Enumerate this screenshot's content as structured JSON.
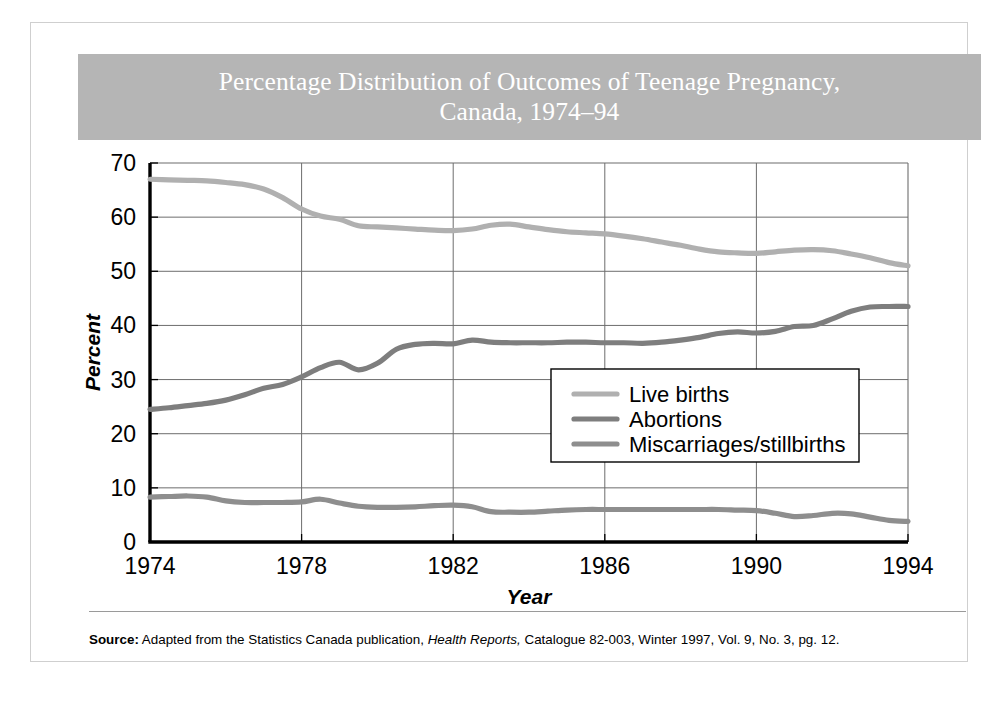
{
  "figure": {
    "title": "Percentage Distribution of Outcomes of Teenage Pregnancy,\nCanada, 1974–94",
    "title_banner_color": "#b5b5b5",
    "title_text_color": "#ffffff",
    "background_color": "#ffffff",
    "border_color": "#cfcfcf"
  },
  "source": {
    "label": "Source:",
    "line1_part1": " Adapted from the Statistics Canada publication, ",
    "line1_italic": "Health Reports,",
    "line1_part2": " Catalogue 82-003, Winter 1997,",
    "line2": "Vol. 9, No. 3, pg. 12.",
    "full_text": "Source: Adapted from the Statistics Canada publication, Health Reports, Catalogue 82-003, Winter 1997, Vol. 9, No. 3, pg. 12."
  },
  "chart_data": {
    "type": "line",
    "title": "Percentage Distribution of Outcomes of Teenage Pregnancy, Canada, 1974–94",
    "xlabel": "Year",
    "ylabel": "Percent",
    "xlim": [
      1974,
      1994
    ],
    "ylim": [
      0,
      70
    ],
    "xticks": [
      1974,
      1978,
      1982,
      1986,
      1990,
      1994
    ],
    "xticklabels": [
      "1974",
      "1978",
      "1982",
      "1986",
      "1990",
      "1994"
    ],
    "yticks": [
      0,
      10,
      20,
      30,
      40,
      50,
      60,
      70
    ],
    "yticklabels": [
      "0",
      "10",
      "20",
      "30",
      "40",
      "50",
      "60",
      "70"
    ],
    "grid": "both",
    "grid_color": "#6d6d6d",
    "legend_position": "center-right",
    "x": [
      1974,
      1974.5,
      1975,
      1975.5,
      1976,
      1976.5,
      1977,
      1977.5,
      1978,
      1978.5,
      1979,
      1979.5,
      1980,
      1980.5,
      1981,
      1981.5,
      1982,
      1982.5,
      1983,
      1983.5,
      1984,
      1984.5,
      1985,
      1985.5,
      1986,
      1986.5,
      1987,
      1987.5,
      1988,
      1988.5,
      1989,
      1989.5,
      1990,
      1990.5,
      1991,
      1991.5,
      1992,
      1992.5,
      1993,
      1993.5,
      1994
    ],
    "series": [
      {
        "name": "Live births",
        "color": "#b0b0b0",
        "values": [
          67.0,
          66.9,
          66.8,
          66.7,
          66.4,
          66.0,
          65.2,
          63.6,
          61.5,
          60.2,
          59.6,
          58.4,
          58.2,
          58.0,
          57.8,
          57.6,
          57.5,
          57.8,
          58.5,
          58.7,
          58.2,
          57.7,
          57.3,
          57.1,
          56.9,
          56.5,
          56.0,
          55.4,
          54.8,
          54.1,
          53.6,
          53.4,
          53.3,
          53.6,
          53.9,
          54.0,
          53.8,
          53.2,
          52.5,
          51.6,
          51.0
        ]
      },
      {
        "name": "Abortions",
        "color": "#7e7e7e",
        "values": [
          24.5,
          24.8,
          25.2,
          25.6,
          26.2,
          27.2,
          28.4,
          29.1,
          30.5,
          32.2,
          33.2,
          31.8,
          33.0,
          35.6,
          36.5,
          36.7,
          36.6,
          37.3,
          36.9,
          36.8,
          36.8,
          36.8,
          36.9,
          36.9,
          36.8,
          36.8,
          36.7,
          36.9,
          37.3,
          37.8,
          38.5,
          38.8,
          38.6,
          38.9,
          39.8,
          40.0,
          41.2,
          42.6,
          43.4,
          43.5,
          43.5
        ]
      },
      {
        "name": "Miscarriages/stillbirths",
        "color": "#8e8e8e",
        "values": [
          8.3,
          8.4,
          8.5,
          8.3,
          7.6,
          7.3,
          7.3,
          7.3,
          7.4,
          7.9,
          7.2,
          6.6,
          6.4,
          6.4,
          6.5,
          6.7,
          6.8,
          6.5,
          5.6,
          5.5,
          5.5,
          5.7,
          5.9,
          6.0,
          6.0,
          6.0,
          6.0,
          6.0,
          6.0,
          6.0,
          6.0,
          5.9,
          5.8,
          5.3,
          4.7,
          4.9,
          5.3,
          5.2,
          4.6,
          4.0,
          3.8
        ]
      }
    ],
    "legend": [
      {
        "label": "Live births",
        "color": "#b0b0b0"
      },
      {
        "label": "Abortions",
        "color": "#7e7e7e"
      },
      {
        "label": "Miscarriages/stillbirths",
        "color": "#8e8e8e"
      }
    ]
  }
}
